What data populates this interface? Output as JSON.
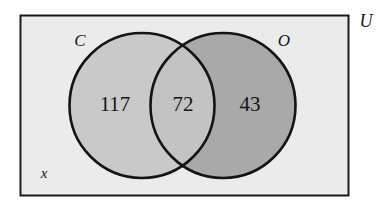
{
  "diagram": {
    "type": "venn",
    "title": "",
    "universe": {
      "label": "U",
      "background_color": "#ebebeb",
      "border_color": "#1a1a1a"
    },
    "sets": [
      {
        "id": "C",
        "label": "C",
        "fill_color": "#c9c9c9",
        "stroke_color": "#141414"
      },
      {
        "id": "O",
        "label": "O",
        "fill_color": "#a9a9a9",
        "stroke_color": "#141414"
      }
    ],
    "regions": [
      {
        "id": "c-only",
        "label": "117",
        "value": 117,
        "fill_color": "#c9c9c9"
      },
      {
        "id": "intersection",
        "label": "72",
        "value": 72,
        "fill_color": "#c3c3c3"
      },
      {
        "id": "o-only",
        "label": "43",
        "value": 43,
        "fill_color": "#a9a9a9"
      }
    ],
    "outside_label": "x"
  }
}
